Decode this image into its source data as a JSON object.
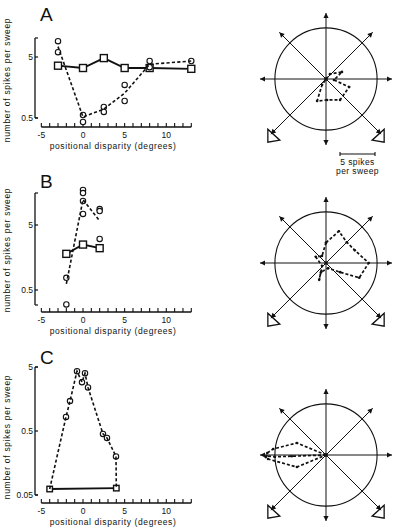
{
  "figure": {
    "panels": [
      {
        "letter": "A",
        "ylabel": "number of spikes per sweep",
        "xlabel": "positional disparity  (degrees)"
      },
      {
        "letter": "B",
        "ylabel": "number of spikes per sweep",
        "xlabel": "positional disparity  (degrees)"
      },
      {
        "letter": "C",
        "ylabel": "number of spikes per sweep",
        "xlabel": "positional disparity  (degrees)"
      }
    ],
    "scale_bar": {
      "value": 5,
      "line1": "5 spikes",
      "line2": "per sweep"
    },
    "colors": {
      "ink": "#111111",
      "background": "#ffffff"
    }
  },
  "chart_data": [
    {
      "panel": "A",
      "type": "scatter",
      "title": "",
      "xlabel": "positional disparity (degrees)",
      "ylabel": "number of spikes per sweep",
      "xscale": "linear",
      "yscale": "log",
      "xlim": [
        -5,
        13
      ],
      "ylim": [
        0.5,
        10
      ],
      "xticks": [
        -5,
        0,
        5,
        10
      ],
      "xtick_labels": [
        "-5",
        "0",
        "5",
        "10"
      ],
      "yticks": [
        5,
        0.5
      ],
      "ytick_labels": [
        "5",
        "0.5"
      ],
      "grid": false,
      "legend": "none",
      "series": [
        {
          "name": "squares",
          "marker": "square",
          "line": "solid",
          "x": [
            -3,
            0,
            2.5,
            5,
            8,
            13
          ],
          "y": [
            3.6,
            3.3,
            4.8,
            3.3,
            3.3,
            3.2
          ]
        },
        {
          "name": "circles",
          "marker": "circle",
          "line": "none",
          "x": [
            -3,
            -3,
            0,
            0,
            2.5,
            2.5,
            5,
            5,
            8,
            8,
            13
          ],
          "y": [
            9.1,
            6.0,
            0.56,
            0.43,
            0.76,
            0.63,
            1.74,
            0.95,
            4.3,
            3.4,
            4.3
          ]
        },
        {
          "name": "circles mean",
          "marker": "none",
          "line": "dashed",
          "x": [
            -3,
            0,
            2.5,
            5,
            8,
            13
          ],
          "y": [
            7.4,
            0.52,
            0.7,
            1.28,
            3.8,
            4.3
          ]
        }
      ]
    },
    {
      "panel": "A",
      "type": "polar",
      "directions_deg": [
        0,
        45,
        90,
        135,
        180,
        225,
        270,
        315
      ],
      "circle_radius": 7.3,
      "r_unit": "spikes per sweep",
      "polylines": [
        [
          [
            0,
            0
          ],
          [
            51,
            0.9
          ],
          [
            24,
            2.5
          ],
          [
            -7,
            1.15
          ],
          [
            -19,
            3.5
          ],
          [
            -56,
            3.6
          ],
          [
            -87,
            3.0
          ],
          [
            -112,
            3.4
          ],
          [
            -124,
            1.0
          ],
          [
            0,
            0
          ]
        ]
      ]
    },
    {
      "panel": "B",
      "type": "scatter",
      "title": "",
      "xlabel": "positional disparity (degrees)",
      "ylabel": "number of spikes per sweep",
      "xscale": "linear",
      "yscale": "log",
      "xlim": [
        -5,
        13
      ],
      "ylim": [
        0.3,
        15
      ],
      "xticks": [
        -5,
        0,
        5,
        10
      ],
      "xtick_labels": [
        "-5",
        "0",
        "5",
        "10"
      ],
      "yticks": [
        5,
        0.5
      ],
      "ytick_labels": [
        "5",
        "0.5"
      ],
      "grid": false,
      "legend": "none",
      "series": [
        {
          "name": "squares",
          "marker": "square",
          "line": "solid",
          "x": [
            -2,
            0,
            2
          ],
          "y": [
            1.8,
            2.5,
            2.2
          ]
        },
        {
          "name": "circles",
          "marker": "circle",
          "line": "none",
          "x": [
            -2,
            -2,
            0,
            0,
            0,
            0,
            2,
            2,
            2
          ],
          "y": [
            0.77,
            0.3,
            17.3,
            15.5,
            11.7,
            7.4,
            8.8,
            8.2,
            3.05
          ]
        },
        {
          "name": "circles mean",
          "marker": "none",
          "line": "dashed",
          "x": [
            -2,
            0,
            2
          ],
          "y": [
            0.62,
            12.3,
            5.8
          ]
        }
      ]
    },
    {
      "panel": "B",
      "type": "polar",
      "directions_deg": [
        0,
        45,
        90,
        135,
        180,
        225,
        270,
        315
      ],
      "circle_radius": 7.3,
      "r_unit": "spikes per sweep",
      "polylines": [
        [
          [
            90,
            2.9
          ],
          [
            68,
            4.9
          ],
          [
            45,
            4.2
          ],
          [
            24,
            4.5
          ],
          [
            0,
            6.1
          ],
          [
            -24,
            5.2
          ],
          [
            -33,
            2.4
          ],
          [
            -68,
            0.8
          ],
          [
            -119,
            1.5
          ],
          [
            -112,
            2.6
          ],
          [
            -143,
            0.7
          ],
          [
            149,
            1.7
          ],
          [
            120,
            1.15
          ],
          [
            90,
            2.9
          ]
        ]
      ]
    },
    {
      "panel": "C",
      "type": "scatter",
      "title": "",
      "xlabel": "positional disparity (degrees)",
      "ylabel": "number of spikes per sweep",
      "xscale": "linear",
      "yscale": "log",
      "xlim": [
        -5,
        13
      ],
      "ylim": [
        0.05,
        5
      ],
      "xticks": [
        -5,
        0,
        5,
        10
      ],
      "xtick_labels": [
        "-5",
        "0",
        "5",
        "10"
      ],
      "yticks": [
        5,
        0.5,
        0.05
      ],
      "ytick_labels": [
        "5",
        "0.5",
        "0.05"
      ],
      "grid": false,
      "legend": "none",
      "series": [
        {
          "name": "squares",
          "marker": "square",
          "line": "solid",
          "x": [
            -4,
            4
          ],
          "y": [
            0.062,
            0.064
          ]
        },
        {
          "name": "circles",
          "marker": "circle",
          "line": "none",
          "x": [
            -2.04,
            -1.56,
            -0.72,
            -0.12,
            0.24,
            0.6,
            2.4,
            2.88,
            3.96
          ],
          "y": [
            0.83,
            1.47,
            4.3,
            2.9,
            4.0,
            2.4,
            0.45,
            0.39,
            0.2
          ]
        },
        {
          "name": "circles mean",
          "marker": "none",
          "line": "dashed",
          "x": [
            -4,
            -2.04,
            -1.56,
            -0.72,
            -0.12,
            0.24,
            0.6,
            2.4,
            2.88,
            3.96,
            4
          ],
          "y": [
            0.062,
            0.83,
            1.47,
            4.3,
            2.9,
            4.0,
            2.4,
            0.45,
            0.39,
            0.2,
            0.064
          ]
        }
      ]
    },
    {
      "panel": "C",
      "type": "polar",
      "directions_deg": [
        0,
        45,
        90,
        135,
        180,
        225,
        270,
        315
      ],
      "circle_radius": 7.3,
      "r_unit": "spikes per sweep",
      "polylines": [
        [
          [
            0,
            0
          ],
          [
            157.5,
            4.5
          ],
          [
            173.5,
            7.6
          ],
          [
            178,
            8.4
          ],
          [
            182,
            8.6
          ],
          [
            184,
            8.3
          ],
          [
            202.5,
            4.5
          ],
          [
            0,
            0
          ]
        ],
        [
          [
            0,
            0
          ],
          [
            182,
            4.9
          ],
          [
            182,
            7.3
          ],
          [
            181,
            8.5
          ]
        ]
      ]
    }
  ]
}
